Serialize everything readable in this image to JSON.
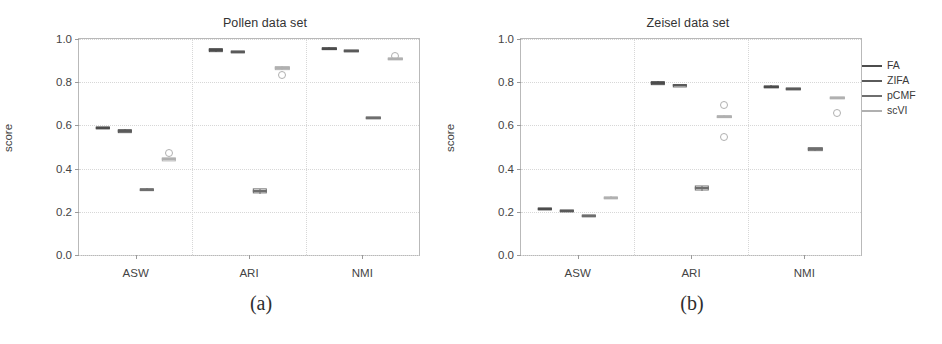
{
  "figure": {
    "legend_title": "",
    "methods": [
      {
        "key": "FA",
        "label": "FA",
        "color": "#4c4c4c"
      },
      {
        "key": "ZIFA",
        "label": "ZIFA",
        "color": "#5a5a5a"
      },
      {
        "key": "pCMF",
        "label": "pCMF",
        "color": "#6e6e6e"
      },
      {
        "key": "scVI",
        "label": "scVI",
        "color": "#b0b0b0"
      }
    ]
  },
  "panels": [
    {
      "id": "a",
      "caption": "(a)",
      "title": "Pollen data set",
      "ylabel": "score",
      "xlabel": "",
      "yticks": [
        "0.0",
        "0.2",
        "0.4",
        "0.6",
        "0.8",
        "1.0"
      ],
      "xticks": [
        "ASW",
        "ARI",
        "NMI"
      ]
    },
    {
      "id": "b",
      "caption": "(b)",
      "title": "Zeisel data set",
      "ylabel": "score",
      "xlabel": "",
      "yticks": [
        "0.0",
        "0.2",
        "0.4",
        "0.6",
        "0.8",
        "1.0"
      ],
      "xticks": [
        "ASW",
        "ARI",
        "NMI"
      ]
    }
  ],
  "chart_data": [
    {
      "type": "box",
      "title": "Pollen data set",
      "xlabel": "",
      "ylabel": "score",
      "ylim": [
        0.0,
        1.0
      ],
      "yticks": [
        0.0,
        0.2,
        0.4,
        0.6,
        0.8,
        1.0
      ],
      "categories": [
        "ASW",
        "ARI",
        "NMI"
      ],
      "grid": true,
      "legend_position": "right-outside",
      "series": [
        {
          "name": "FA",
          "boxes": [
            {
              "category": "ASW",
              "median": 0.59,
              "q1": 0.588,
              "q3": 0.592,
              "low": 0.586,
              "high": 0.594,
              "outliers": []
            },
            {
              "category": "ARI",
              "median": 0.948,
              "q1": 0.944,
              "q3": 0.952,
              "low": 0.94,
              "high": 0.956,
              "outliers": []
            },
            {
              "category": "NMI",
              "median": 0.955,
              "q1": 0.951,
              "q3": 0.959,
              "low": 0.948,
              "high": 0.962,
              "outliers": []
            }
          ]
        },
        {
          "name": "ZIFA",
          "boxes": [
            {
              "category": "ASW",
              "median": 0.575,
              "q1": 0.571,
              "q3": 0.579,
              "low": 0.568,
              "high": 0.582,
              "outliers": []
            },
            {
              "category": "ARI",
              "median": 0.94,
              "q1": 0.938,
              "q3": 0.942,
              "low": 0.936,
              "high": 0.944,
              "outliers": []
            },
            {
              "category": "NMI",
              "median": 0.945,
              "q1": 0.943,
              "q3": 0.947,
              "low": 0.941,
              "high": 0.949,
              "outliers": []
            }
          ]
        },
        {
          "name": "pCMF",
          "boxes": [
            {
              "category": "ASW",
              "median": 0.303,
              "q1": 0.299,
              "q3": 0.307,
              "low": 0.296,
              "high": 0.31,
              "outliers": []
            },
            {
              "category": "ARI",
              "median": 0.295,
              "q1": 0.288,
              "q3": 0.303,
              "low": 0.284,
              "high": 0.307,
              "outliers": []
            },
            {
              "category": "NMI",
              "median": 0.635,
              "q1": 0.632,
              "q3": 0.638,
              "low": 0.629,
              "high": 0.641,
              "outliers": []
            }
          ]
        },
        {
          "name": "scVI",
          "boxes": [
            {
              "category": "ASW",
              "median": 0.443,
              "q1": 0.44,
              "q3": 0.446,
              "low": 0.438,
              "high": 0.448,
              "outliers": [
                0.47
              ]
            },
            {
              "category": "ARI",
              "median": 0.866,
              "q1": 0.862,
              "q3": 0.87,
              "low": 0.858,
              "high": 0.874,
              "outliers": [
                0.833
              ]
            },
            {
              "category": "NMI",
              "median": 0.908,
              "q1": 0.905,
              "q3": 0.911,
              "low": 0.902,
              "high": 0.914,
              "outliers": [
                0.922
              ]
            }
          ]
        }
      ]
    },
    {
      "type": "box",
      "title": "Zeisel data set",
      "xlabel": "",
      "ylabel": "score",
      "ylim": [
        0.0,
        1.0
      ],
      "yticks": [
        0.0,
        0.2,
        0.4,
        0.6,
        0.8,
        1.0
      ],
      "categories": [
        "ASW",
        "ARI",
        "NMI"
      ],
      "grid": true,
      "legend_position": "right-outside",
      "series": [
        {
          "name": "FA",
          "boxes": [
            {
              "category": "ASW",
              "median": 0.214,
              "q1": 0.212,
              "q3": 0.216,
              "low": 0.21,
              "high": 0.218,
              "outliers": []
            },
            {
              "category": "ARI",
              "median": 0.797,
              "q1": 0.793,
              "q3": 0.801,
              "low": 0.79,
              "high": 0.804,
              "outliers": []
            },
            {
              "category": "NMI",
              "median": 0.779,
              "q1": 0.776,
              "q3": 0.782,
              "low": 0.773,
              "high": 0.785,
              "outliers": []
            }
          ]
        },
        {
          "name": "ZIFA",
          "boxes": [
            {
              "category": "ASW",
              "median": 0.205,
              "q1": 0.203,
              "q3": 0.207,
              "low": 0.201,
              "high": 0.209,
              "outliers": []
            },
            {
              "category": "ARI",
              "median": 0.785,
              "q1": 0.783,
              "q3": 0.787,
              "low": 0.781,
              "high": 0.789,
              "outliers": []
            },
            {
              "category": "NMI",
              "median": 0.77,
              "q1": 0.768,
              "q3": 0.772,
              "low": 0.766,
              "high": 0.774,
              "outliers": []
            }
          ]
        },
        {
          "name": "pCMF",
          "boxes": [
            {
              "category": "ASW",
              "median": 0.18,
              "q1": 0.177,
              "q3": 0.183,
              "low": 0.175,
              "high": 0.186,
              "outliers": []
            },
            {
              "category": "ARI",
              "median": 0.308,
              "q1": 0.302,
              "q3": 0.316,
              "low": 0.298,
              "high": 0.32,
              "outliers": []
            },
            {
              "category": "NMI",
              "median": 0.489,
              "q1": 0.485,
              "q3": 0.493,
              "low": 0.482,
              "high": 0.496,
              "outliers": []
            }
          ]
        },
        {
          "name": "scVI",
          "boxes": [
            {
              "category": "ASW",
              "median": 0.266,
              "q1": 0.263,
              "q3": 0.269,
              "low": 0.26,
              "high": 0.272,
              "outliers": []
            },
            {
              "category": "ARI",
              "median": 0.64,
              "q1": 0.636,
              "q3": 0.644,
              "low": 0.632,
              "high": 0.648,
              "outliers": [
                0.695,
                0.548
              ]
            },
            {
              "category": "NMI",
              "median": 0.726,
              "q1": 0.723,
              "q3": 0.729,
              "low": 0.72,
              "high": 0.732,
              "outliers": [
                0.657
              ]
            }
          ]
        }
      ]
    }
  ]
}
